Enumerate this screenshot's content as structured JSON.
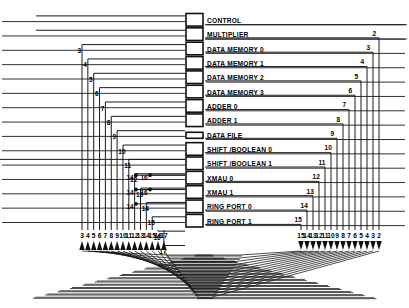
{
  "diagram": {
    "modules": [
      {
        "label": "CONTROL",
        "box": "square"
      },
      {
        "label": "MULTIPLIER",
        "box": "square"
      },
      {
        "label": "DATA MEMORY 0",
        "box": "square"
      },
      {
        "label": "DATA MEMORY 1",
        "box": "square"
      },
      {
        "label": "DATA MEMORY 2",
        "box": "square"
      },
      {
        "label": "DATA MEMORY 3",
        "box": "square"
      },
      {
        "label": "ADDER  0",
        "box": "square"
      },
      {
        "label": "ADDER  1",
        "box": "square"
      },
      {
        "label": "DATA FILE",
        "box": "flat"
      },
      {
        "label": "SHIFT /BOOLEAN 0",
        "box": "square"
      },
      {
        "label": "SHIFT /BOOLEAN 1",
        "box": "square"
      },
      {
        "label": "XMAU 0",
        "box": "square"
      },
      {
        "label": "XMAU 1",
        "box": "square"
      },
      {
        "label": "RING PORT 0",
        "box": "square"
      },
      {
        "label": "RING PORT 1",
        "box": "square"
      }
    ],
    "left_cascade_numbers": [
      "3",
      "4",
      "5",
      "6",
      "7",
      "8",
      "9",
      "10",
      "11",
      "12",
      "13",
      "14",
      "15",
      "16",
      "17"
    ],
    "right_cascade_numbers": [
      "2",
      "3",
      "4",
      "5",
      "6",
      "7",
      "8",
      "9",
      "10",
      "11",
      "12",
      "13",
      "14",
      "15"
    ],
    "inner_junction_numbers": [
      "14",
      "16",
      "14",
      "16",
      "14"
    ],
    "bottom_left_ports": [
      "3",
      "4",
      "5",
      "6",
      "7",
      "8",
      "9",
      "10",
      "11",
      "12",
      "13",
      "14",
      "15",
      "16",
      "17"
    ],
    "bottom_right_ports": [
      "15",
      "14",
      "13",
      "12",
      "11",
      "10",
      "9",
      "8",
      "7",
      "6",
      "5",
      "4",
      "3",
      "2"
    ],
    "colors": {
      "line": "#1a1a1a",
      "box_stroke": "#111111",
      "background": "#ffffff",
      "text": "#000000"
    }
  }
}
